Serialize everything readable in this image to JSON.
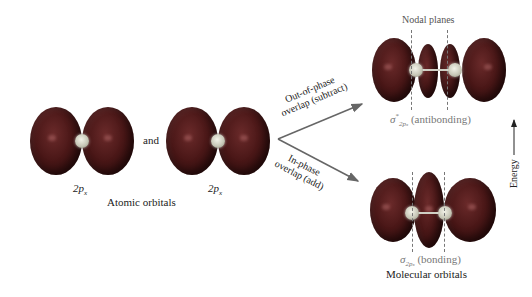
{
  "figure": {
    "type": "molecular-orbital-formation-diagram",
    "atomic_orbitals": {
      "left_label": "2p",
      "left_label_sub": "x",
      "right_label": "2p",
      "right_label_sub": "x",
      "connector": "and",
      "caption": "Atomic orbitals"
    },
    "arrows": {
      "upper_label_line1": "Out-of-phase",
      "upper_label_line2": "overlap (subtract)",
      "lower_label_line1": "In-phase",
      "lower_label_line2": "overlap (add)"
    },
    "molecular_orbitals": {
      "antibonding": {
        "symbol": "σ",
        "subscript": "2p",
        "subsub": "x",
        "superscript": "*",
        "description": "(antibonding)"
      },
      "bonding": {
        "symbol": "σ",
        "subscript": "2p",
        "subsub": "x",
        "description": "(bonding)"
      },
      "caption": "Molecular orbitals",
      "nodal_label": "Nodal planes"
    },
    "energy_axis": {
      "label": "Energy"
    },
    "colors": {
      "lobe": "#4a1717",
      "nucleus": "#d8d8cc",
      "arrow": "#666666",
      "label_gray": "#777777"
    }
  }
}
